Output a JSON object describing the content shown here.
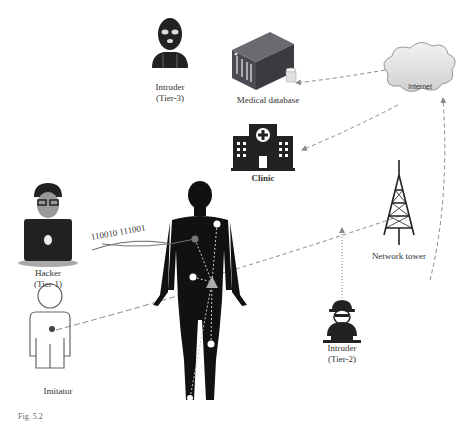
{
  "diagram": {
    "nodes": {
      "intruder_tier3": {
        "name": "Intruder",
        "tier": "(Tier-3)"
      },
      "medical_database": {
        "name": "Medical database"
      },
      "internet": {
        "name": "Internet"
      },
      "clinic": {
        "name": "Clinic"
      },
      "network_tower": {
        "name": "Network tower"
      },
      "hacker_tier1": {
        "name": "Hacker",
        "tier": "(Tier-1)"
      },
      "intruder_tier2": {
        "name": "Intruder",
        "tier": "(Tier-2)"
      },
      "imitator": {
        "name": "Imitator"
      }
    },
    "binary_stream": "110010  111001",
    "caption": "Fig. 5.2"
  }
}
